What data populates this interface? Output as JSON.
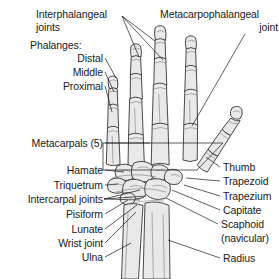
{
  "figure": {
    "background_color": "#ffffff",
    "bone_fill_color": "#e9e9e9",
    "bone_outline_color": "#2b2b2b",
    "leader_line_color": "#1a1a1a",
    "text_color": "#1a1a1a"
  },
  "labels": {
    "interphalangeal_joints_line1": "Interphalangeal",
    "interphalangeal_joints_line2": "joints",
    "metacarpophalangeal_line1": "Metacarpophalangeal",
    "metacarpophalangeal_line2": "joint",
    "phalanges_heading": "Phalanges:",
    "phalanx_distal": "Distal",
    "phalanx_middle": "Middle",
    "phalanx_proximal": "Proximal",
    "metacarpals": "Metacarpals (5)",
    "hamate": "Hamate",
    "triquetrum": "Triquetrum",
    "intercarpal_joints": "Intercarpal joints",
    "pisiform": "Pisiform",
    "lunate": "Lunate",
    "wrist_joint": "Wrist joint",
    "ulna": "Ulna",
    "thumb": "Thumb",
    "trapezoid": "Trapezoid",
    "trapezium": "Trapezium",
    "capitate": "Capitate",
    "scaphoid_line1": "Scaphoid",
    "scaphoid_line2": "(navicular)",
    "radius": "Radius"
  }
}
